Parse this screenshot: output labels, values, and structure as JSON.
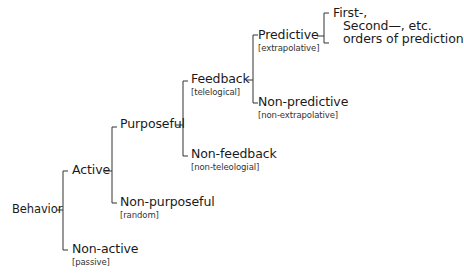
{
  "diagram": {
    "type": "tree",
    "title": "",
    "root": {
      "id": "behavior",
      "label": "Behavior",
      "children": [
        {
          "id": "active",
          "label": "Active",
          "children": [
            {
              "id": "purposeful",
              "label": "Purposeful",
              "children": [
                {
                  "id": "feedback",
                  "label": "Feedback",
                  "sublabel": "[telelogical]",
                  "children": [
                    {
                      "id": "predictive",
                      "label": "Predictive",
                      "sublabel": "[extrapolative]",
                      "children": [
                        {
                          "id": "orders",
                          "lines": [
                            "First-,",
                            "Second—, etc.",
                            "orders of prediction"
                          ]
                        }
                      ]
                    },
                    {
                      "id": "non-predictive",
                      "label": "Non-predictive",
                      "sublabel": "[non-extrapolative]"
                    }
                  ]
                },
                {
                  "id": "non-feedback",
                  "label": "Non-feedback",
                  "sublabel": "[non-teleologial]"
                }
              ]
            },
            {
              "id": "non-purposeful",
              "label": "Non-purposeful",
              "sublabel": "[random]"
            }
          ]
        },
        {
          "id": "non-active",
          "label": "Non-active",
          "sublabel": "[passive]"
        }
      ]
    }
  },
  "nodes": {
    "behavior": {
      "label": "Behavior"
    },
    "active": {
      "label": "Active"
    },
    "non_active": {
      "label": "Non-active",
      "sublabel": "[passive]"
    },
    "purposeful": {
      "label": "Purposeful"
    },
    "non_purposeful": {
      "label": "Non-purposeful",
      "sublabel": "[random]"
    },
    "feedback": {
      "label": "Feedback",
      "sublabel": "[telelogical]"
    },
    "non_feedback": {
      "label": "Non-feedback",
      "sublabel": "[non-teleologial]"
    },
    "predictive": {
      "label": "Predictive",
      "sublabel": "[extrapolative]"
    },
    "non_predictive": {
      "label": "Non-predictive",
      "sublabel": "[non-extrapolative]"
    },
    "orders": {
      "line1": "First-,",
      "line2": "Second—, etc.",
      "line3": "orders of prediction"
    }
  },
  "colors": {
    "text": "#1a1a1a",
    "sublabel": "#333333",
    "line": "#333333",
    "background": "#ffffff"
  }
}
